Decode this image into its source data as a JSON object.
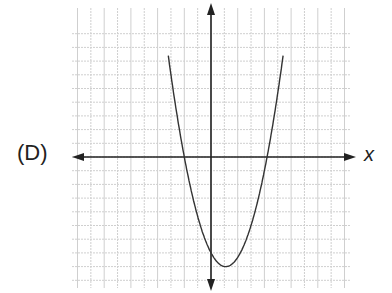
{
  "option_label": "(D)",
  "chart_data": {
    "type": "line",
    "title": "",
    "xlabel": "x",
    "ylabel": "",
    "grid": true,
    "xlim": [
      -10,
      10
    ],
    "ylim": [
      -9,
      11
    ],
    "function": "y = 0.83 * (x - 1.1)^2 - 8",
    "vertex": [
      1.1,
      -8
    ],
    "y_intercept": -7,
    "x_intercepts": [
      -2,
      3.9
    ],
    "x": [
      -3.2,
      -2,
      -1,
      0,
      1.1,
      2,
      3,
      3.9,
      5.4
    ],
    "y": [
      10.4,
      0,
      -3.6,
      -7,
      -8,
      -7.3,
      -5,
      0,
      7.3
    ],
    "colors": {
      "curve": "#333333",
      "axes": "#222222",
      "grid": "#cfcfcf"
    }
  }
}
